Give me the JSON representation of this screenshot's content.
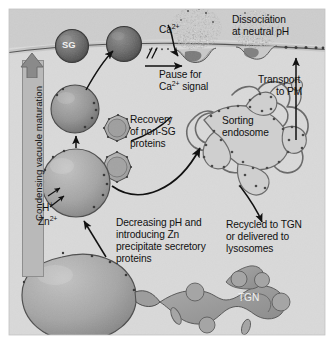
{
  "figure": {
    "domain": "biology-diagram",
    "background_color": "#d9d9d9",
    "border_color": "#ffffff",
    "ink_color": "#111111"
  },
  "axis_label": {
    "text": "Condensing vacuole maturation",
    "direction": "up",
    "arrow_icon": "up-arrow-icon"
  },
  "labels": {
    "sg": "SG",
    "calcium": "Ca",
    "calcium_charge": "2+",
    "pause": "Pause for",
    "pause_line2": "Ca",
    "pause_line2_charge": "2+",
    "pause_line2_tail": " signal",
    "dissociation_line1": "Dissociation",
    "dissociation_line2": "at neutral pH",
    "transport_line1": "Transport",
    "transport_line2": "to PM",
    "recovery_line1": "Recovery",
    "recovery_line2": "of non-SG",
    "recovery_line3": "proteins",
    "sorting_line1": "Sorting",
    "sorting_line2": "endosome",
    "recycled_line1": "Recycled to TGN",
    "recycled_line2": "or delivered to",
    "recycled_line3": "lysosomes",
    "decreasing_line1": "Decreasing pH and",
    "decreasing_line2": "introducing Zn",
    "decreasing_line3": "precipitate secretory",
    "decreasing_line4": "proteins",
    "proton": "H",
    "proton_charge": "+",
    "zinc": "Zn",
    "zinc_charge": "2+",
    "tgn": "TGN"
  },
  "structures": [
    {
      "name": "plasma-membrane",
      "type": "membrane"
    },
    {
      "name": "secretory-granule-sg",
      "type": "granule"
    },
    {
      "name": "secretory-granule-docked",
      "type": "granule"
    },
    {
      "name": "exocytosis-pit-left",
      "type": "fusion-pore"
    },
    {
      "name": "exocytosis-pit-right",
      "type": "fusion-pore"
    },
    {
      "name": "immature-granule",
      "type": "granule"
    },
    {
      "name": "clathrin-coated-vesicle-upper",
      "type": "coated-vesicle"
    },
    {
      "name": "clathrin-coated-vesicle-lower",
      "type": "coated-vesicle"
    },
    {
      "name": "condensing-vacuole",
      "type": "vacuole"
    },
    {
      "name": "trans-golgi-network",
      "type": "tgn"
    },
    {
      "name": "sorting-endosome",
      "type": "endosome"
    }
  ]
}
